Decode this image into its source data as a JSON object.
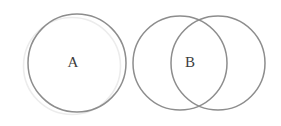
{
  "canvas": {
    "width": 281,
    "height": 126,
    "background_color": "#ffffff"
  },
  "diagram": {
    "type": "venn-diagram",
    "title": "",
    "groups": [
      {
        "name": "left-group",
        "description": "single circle with a faint duplicate circle offset behind it"
      },
      {
        "name": "right-group",
        "description": "two overlapping circles forming a lens-shaped intersection"
      }
    ]
  },
  "shapes": {
    "ghost_circle": {
      "name": "ghost-circle",
      "cx": 72,
      "cy": 66,
      "r": 48.5,
      "stroke_color": "#ececec",
      "stroke_width": 1.6,
      "fill": "none"
    },
    "circle_a": {
      "name": "circle-a",
      "cx": 77,
      "cy": 63,
      "r": 49,
      "stroke_color": "#8d8d8d",
      "stroke_width": 1.5,
      "fill": "none"
    },
    "circle_b_left": {
      "name": "circle-b-left",
      "cx": 180,
      "cy": 63,
      "r": 47,
      "stroke_color": "#8d8d8d",
      "stroke_width": 1.5,
      "fill": "none"
    },
    "circle_b_right": {
      "name": "circle-b-right",
      "cx": 218,
      "cy": 63,
      "r": 47,
      "stroke_color": "#8d8d8d",
      "stroke_width": 1.5,
      "fill": "none"
    }
  },
  "labels": {
    "label_a": {
      "text": "A",
      "x": 73,
      "y": 64,
      "color": "#3d3d3d",
      "font_size": 15
    },
    "label_b": {
      "text": "B",
      "x": 190,
      "y": 64,
      "color": "#3d3d3d",
      "font_size": 15
    }
  }
}
